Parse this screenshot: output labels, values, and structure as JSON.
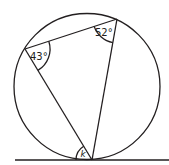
{
  "diagram": {
    "type": "circle-inscribed-triangle-with-tangent",
    "circle": {
      "cx": 87,
      "cy": 86.5,
      "r": 73
    },
    "vertices": {
      "A": {
        "x": 25,
        "y": 49
      },
      "B": {
        "x": 117,
        "y": 19
      },
      "C": {
        "x": 92,
        "y": 160
      }
    },
    "tangent_line": {
      "x1": 15,
      "y1": 160,
      "x2": 169,
      "y2": 160
    },
    "angles": {
      "at_A": {
        "label": "43°",
        "value": 43
      },
      "at_B": {
        "label": "52°",
        "value": 52
      },
      "tangent_angle": {
        "label": "k"
      }
    },
    "stroke_color": "#231f20"
  }
}
